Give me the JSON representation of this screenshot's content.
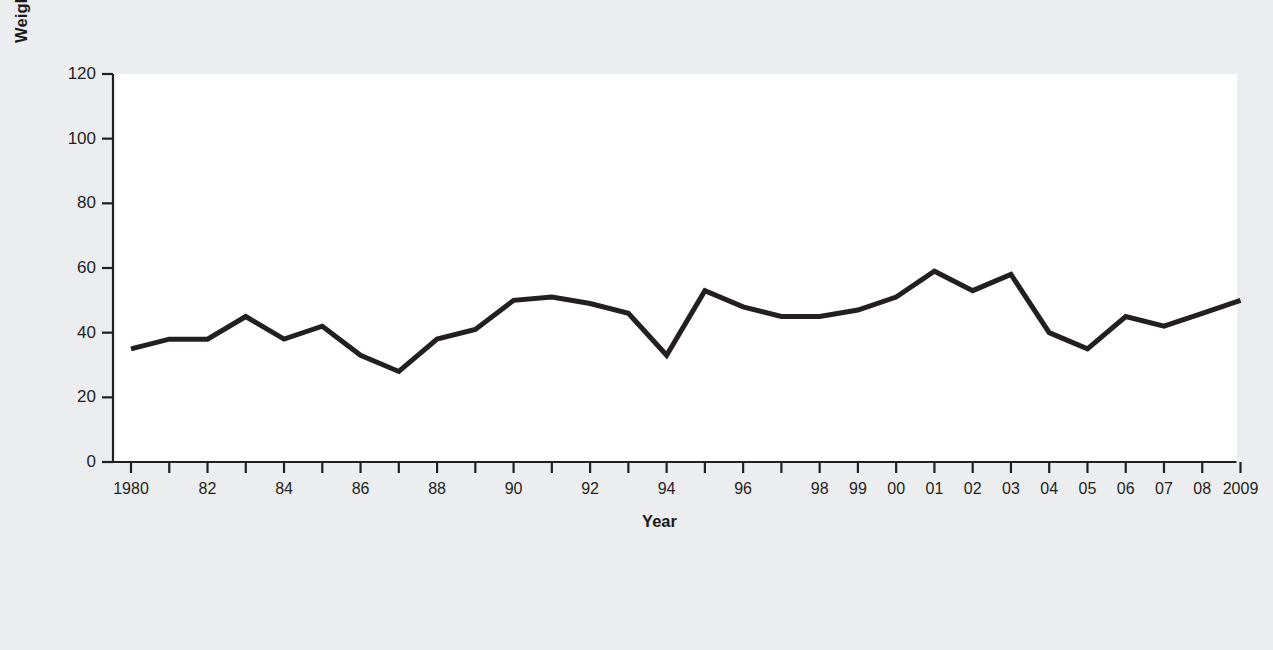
{
  "chart_data": {
    "type": "line",
    "title": "",
    "xlabel": "Year",
    "ylabel": "Weighted Average Maturity in Days",
    "ylim": [
      0,
      120
    ],
    "yticks": [
      0,
      20,
      40,
      60,
      80,
      100,
      120
    ],
    "ytick_labels": [
      "0",
      "20",
      "40",
      "60",
      "80",
      "100",
      "120"
    ],
    "grid": false,
    "legend": null,
    "line_color": "#231f20",
    "line_width_px": 5,
    "x": [
      1980,
      1981,
      1982,
      1983,
      1984,
      1985,
      1986,
      1987,
      1988,
      1989,
      1990,
      1991,
      1992,
      1993,
      1994,
      1995,
      1996,
      1997,
      1998,
      1999,
      2000,
      2001,
      2002,
      2003,
      2004,
      2005,
      2006,
      2007,
      2008,
      2009
    ],
    "xtick_labels": [
      "1980",
      "",
      "82",
      "",
      "84",
      "",
      "86",
      "",
      "88",
      "",
      "90",
      "",
      "92",
      "",
      "94",
      "",
      "96",
      "",
      "98",
      "99",
      "00",
      "01",
      "02",
      "03",
      "04",
      "05",
      "06",
      "07",
      "08",
      "2009"
    ],
    "values": [
      35,
      38,
      38,
      45,
      38,
      42,
      33,
      28,
      38,
      41,
      50,
      51,
      49,
      46,
      33,
      53,
      48,
      45,
      45,
      47,
      51,
      59,
      53,
      58,
      40,
      35,
      45,
      42,
      46,
      50
    ],
    "categories": [
      "1980",
      "1981",
      "1982",
      "1983",
      "1984",
      "1985",
      "1986",
      "1987",
      "1988",
      "1989",
      "1990",
      "1991",
      "1992",
      "1993",
      "1994",
      "1995",
      "1996",
      "1997",
      "1998",
      "1999",
      "2000",
      "2001",
      "2002",
      "2003",
      "2004",
      "2005",
      "2006",
      "2007",
      "2008",
      "2009"
    ]
  },
  "colors": {
    "page_background": "#ecedee",
    "plot_background": "#ffffff",
    "axis": "#231f20",
    "text": "#1f1f1f"
  }
}
